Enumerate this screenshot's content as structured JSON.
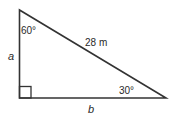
{
  "diagram": {
    "type": "right-triangle",
    "labels": {
      "top_angle": "60°",
      "bottom_right_angle": "30°",
      "hypotenuse": "28 m",
      "vertical_side": "a",
      "horizontal_side": "b"
    },
    "colors": {
      "stroke": "#333333",
      "text": "#2a2a2a",
      "background": "#ffffff"
    }
  }
}
